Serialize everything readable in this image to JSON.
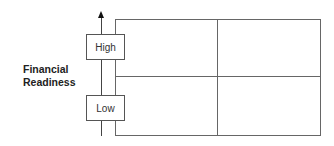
{
  "diagram": {
    "type": "2x2 matrix",
    "y_axis": {
      "label_line1": "Financial",
      "label_line2": "Readiness",
      "levels": [
        {
          "label": "High"
        },
        {
          "label": "Low"
        }
      ],
      "arrow_direction": "up"
    },
    "grid": {
      "rows": 2,
      "columns": 2,
      "cells": [
        "",
        "",
        "",
        ""
      ]
    },
    "colors": {
      "line": "#666666",
      "arrow": "#111111",
      "text": "#222222",
      "background": "#ffffff"
    }
  }
}
